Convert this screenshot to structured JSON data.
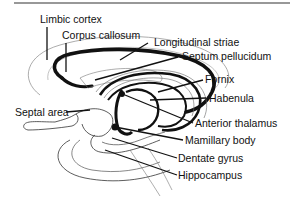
{
  "diagram": {
    "type": "anatomical-illustration",
    "labels": [
      {
        "id": "limbic-cortex",
        "text": "Limbic cortex"
      },
      {
        "id": "corpus-callosum",
        "text": "Corpus callosum"
      },
      {
        "id": "longitudinal-striae",
        "text": "Longitudinal striae"
      },
      {
        "id": "septum-pellucidum",
        "text": "Septum pellucidum"
      },
      {
        "id": "fornix",
        "text": "Fornix"
      },
      {
        "id": "habenula",
        "text": "Habenula"
      },
      {
        "id": "septal-area",
        "text": "Septal area"
      },
      {
        "id": "anterior-thalamus",
        "text": "Anterior thalamus"
      },
      {
        "id": "mamillary-body",
        "text": "Mamillary body"
      },
      {
        "id": "dentate-gyrus",
        "text": "Dentate gyrus"
      },
      {
        "id": "hippocampus",
        "text": "Hippocampus"
      }
    ],
    "colors": {
      "ink": "#111111",
      "thin_outline": "#888888",
      "background": "#ffffff"
    }
  }
}
